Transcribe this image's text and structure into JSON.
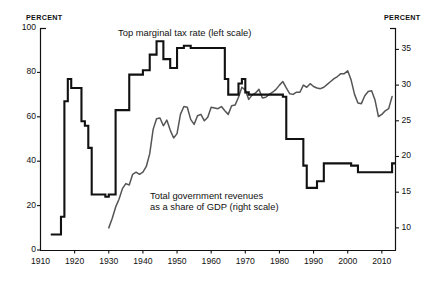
{
  "figure": {
    "left_axis_unit": "PERCENT",
    "right_axis_unit": "PERCENT",
    "background_color": "#ffffff",
    "line_color": "#111111"
  },
  "labels": {
    "tax_series": "Top marginal tax rate (left scale)",
    "revenue_series_line1": "Total government revenues",
    "revenue_series_line2": "as a share of GDP (right scale)"
  },
  "chart_data": {
    "type": "line",
    "title": "",
    "subtitle": "",
    "xlabel": "",
    "ylabel": "PERCENT",
    "y2label": "PERCENT",
    "grid": false,
    "legend_position": "inline-annotation",
    "xlim": [
      1910,
      2014
    ],
    "ylim": [
      0,
      100
    ],
    "y2lim": [
      6.9,
      38
    ],
    "xticks": [
      1910,
      1920,
      1930,
      1940,
      1950,
      1960,
      1970,
      1980,
      1990,
      2000,
      2010
    ],
    "yticks": [
      0,
      20,
      40,
      60,
      80,
      100
    ],
    "y2ticks": [
      10,
      15,
      20,
      25,
      30,
      35
    ],
    "series": [
      {
        "name": "Top marginal tax rate (left scale)",
        "axis": "left",
        "units": "percent",
        "color": "#111111",
        "line_width": 2.1,
        "x": [
          1913,
          1914,
          1915,
          1916,
          1917,
          1918,
          1919,
          1920,
          1921,
          1922,
          1923,
          1924,
          1925,
          1926,
          1927,
          1928,
          1929,
          1930,
          1931,
          1932,
          1933,
          1934,
          1935,
          1936,
          1937,
          1938,
          1939,
          1940,
          1941,
          1942,
          1943,
          1944,
          1945,
          1946,
          1947,
          1948,
          1949,
          1950,
          1951,
          1952,
          1953,
          1954,
          1955,
          1956,
          1957,
          1958,
          1959,
          1960,
          1961,
          1962,
          1963,
          1964,
          1965,
          1966,
          1967,
          1968,
          1969,
          1970,
          1971,
          1972,
          1973,
          1974,
          1975,
          1976,
          1977,
          1978,
          1979,
          1980,
          1981,
          1982,
          1983,
          1984,
          1985,
          1986,
          1987,
          1988,
          1989,
          1990,
          1991,
          1992,
          1993,
          1994,
          1995,
          1996,
          1997,
          1998,
          1999,
          2000,
          2001,
          2002,
          2003,
          2004,
          2005,
          2006,
          2007,
          2008,
          2009,
          2010,
          2011,
          2012,
          2013,
          2014
        ],
        "y": [
          7,
          7,
          7,
          15,
          67,
          77,
          73,
          73,
          73,
          58,
          56,
          46,
          25,
          25,
          25,
          25,
          24,
          25,
          25,
          63,
          63,
          63,
          63,
          79,
          79,
          79,
          79,
          81,
          81,
          88,
          88,
          94,
          94,
          86,
          86,
          82,
          82,
          91,
          91,
          92,
          92,
          91,
          91,
          91,
          91,
          91,
          91,
          91,
          91,
          91,
          91,
          77,
          70,
          70,
          70,
          75,
          77,
          71,
          70,
          70,
          70,
          70,
          70,
          70,
          70,
          70,
          70,
          70,
          69,
          50,
          50,
          50,
          50,
          50,
          38,
          28,
          28,
          28,
          31,
          31,
          39,
          39,
          39,
          39,
          39,
          39,
          39,
          39,
          38,
          38,
          35,
          35,
          35,
          35,
          35,
          35,
          35,
          35,
          35,
          35,
          39,
          39
        ]
      },
      {
        "name": "Total government revenues as a share of GDP (right scale)",
        "axis": "right",
        "units": "percent of GDP",
        "color": "#555555",
        "line_width": 1.5,
        "x": [
          1930,
          1931,
          1932,
          1933,
          1934,
          1935,
          1936,
          1937,
          1938,
          1939,
          1940,
          1941,
          1942,
          1943,
          1944,
          1945,
          1946,
          1947,
          1948,
          1949,
          1950,
          1951,
          1952,
          1953,
          1954,
          1955,
          1956,
          1957,
          1958,
          1959,
          1960,
          1961,
          1962,
          1963,
          1964,
          1965,
          1966,
          1967,
          1968,
          1969,
          1970,
          1971,
          1972,
          1973,
          1974,
          1975,
          1976,
          1977,
          1978,
          1979,
          1980,
          1981,
          1982,
          1983,
          1984,
          1985,
          1986,
          1987,
          1988,
          1989,
          1990,
          1991,
          1992,
          1993,
          1994,
          1995,
          1996,
          1997,
          1998,
          1999,
          2000,
          2001,
          2002,
          2003,
          2004,
          2005,
          2006,
          2007,
          2008,
          2009,
          2010,
          2011,
          2012,
          2013
        ],
        "y": [
          10.0,
          11.3,
          12.9,
          14.0,
          15.5,
          16.2,
          16.0,
          17.5,
          17.8,
          17.5,
          17.8,
          18.6,
          20.4,
          23.8,
          25.3,
          25.4,
          24.3,
          25.1,
          23.7,
          22.6,
          23.2,
          25.9,
          27.0,
          26.9,
          25.2,
          24.5,
          25.7,
          25.9,
          25.0,
          25.5,
          26.9,
          26.8,
          26.7,
          27.0,
          26.4,
          25.9,
          27.1,
          27.2,
          28.3,
          29.7,
          29.3,
          28.0,
          28.6,
          28.9,
          29.4,
          28.2,
          28.3,
          28.7,
          29.0,
          29.4,
          30.0,
          30.5,
          29.6,
          28.8,
          28.7,
          29.0,
          29.0,
          30.0,
          29.7,
          30.2,
          29.8,
          29.6,
          29.5,
          29.7,
          30.1,
          30.5,
          30.9,
          31.2,
          31.6,
          31.6,
          32.0,
          30.7,
          28.7,
          27.5,
          27.4,
          28.5,
          29.1,
          29.2,
          27.9,
          25.6,
          25.9,
          26.4,
          26.7,
          28.4
        ]
      }
    ],
    "annotations": [
      {
        "text": "Top marginal tax rate (left scale)",
        "x": 1935,
        "y": 97,
        "axis": "left"
      },
      {
        "text": "Total government revenues as a share of GDP (right scale)",
        "x": 1948,
        "y": 26,
        "axis": "left"
      }
    ]
  }
}
